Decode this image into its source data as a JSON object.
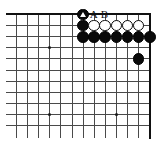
{
  "figure": {
    "kind": "go-board-diagram",
    "title": "",
    "board_style": "partial-corner",
    "line_color": "#4a4a4a",
    "edge_color": "#111111",
    "black_color": "#0a0a0a",
    "white_color": "#ffffff",
    "background": "#ffffff"
  },
  "geometry": {
    "origin_x": 16,
    "origin_y": 14,
    "spacing": 11.1,
    "cols": 13,
    "rows": 11
  },
  "edges": {
    "top": true,
    "right": true,
    "bottom": false,
    "left": false
  },
  "star_points": [
    {
      "col": 3,
      "row": 3
    },
    {
      "col": 3,
      "row": 9
    },
    {
      "col": 9,
      "row": 9
    }
  ],
  "stones": [
    {
      "color": "black",
      "col": 6,
      "row": 0,
      "mark": "triangle"
    },
    {
      "color": "black",
      "col": 6,
      "row": 1,
      "mark": ""
    },
    {
      "color": "white",
      "col": 7,
      "row": 1,
      "mark": ""
    },
    {
      "color": "white",
      "col": 8,
      "row": 1,
      "mark": ""
    },
    {
      "color": "white",
      "col": 9,
      "row": 1,
      "mark": ""
    },
    {
      "color": "white",
      "col": 10,
      "row": 1,
      "mark": ""
    },
    {
      "color": "white",
      "col": 11,
      "row": 1,
      "mark": ""
    },
    {
      "color": "black",
      "col": 6,
      "row": 2,
      "mark": ""
    },
    {
      "color": "black",
      "col": 7,
      "row": 2,
      "mark": ""
    },
    {
      "color": "black",
      "col": 8,
      "row": 2,
      "mark": ""
    },
    {
      "color": "black",
      "col": 9,
      "row": 2,
      "mark": ""
    },
    {
      "color": "black",
      "col": 10,
      "row": 2,
      "mark": ""
    },
    {
      "color": "black",
      "col": 11,
      "row": 2,
      "mark": ""
    },
    {
      "color": "black",
      "col": 12,
      "row": 2,
      "mark": ""
    },
    {
      "color": "black",
      "col": 11,
      "row": 4,
      "mark": ""
    }
  ],
  "point_labels": [
    {
      "text": "A",
      "col": 7,
      "row": 0
    },
    {
      "text": "B",
      "col": 8,
      "row": 0
    }
  ]
}
